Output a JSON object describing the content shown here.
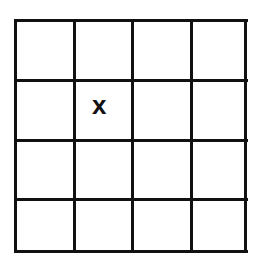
{
  "grid": {
    "rows": 4,
    "cols": 4,
    "line_color": "#111111",
    "cells": [
      [
        "",
        "",
        "",
        ""
      ],
      [
        "",
        "x",
        "",
        ""
      ],
      [
        "",
        "",
        "",
        ""
      ],
      [
        "",
        "",
        "",
        ""
      ]
    ]
  },
  "marks": [
    {
      "row": 1,
      "col": 1,
      "label": "x"
    }
  ]
}
